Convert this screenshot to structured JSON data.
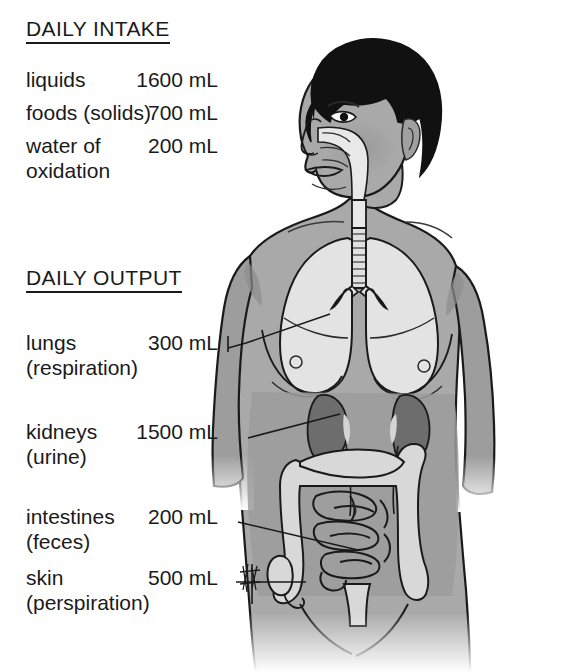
{
  "intake": {
    "heading": "DAILY INTAKE",
    "rows": [
      {
        "name": "liquids",
        "sub": "",
        "value": "1600 mL"
      },
      {
        "name": "foods (solids)",
        "sub": "",
        "value": "700 mL"
      },
      {
        "name": "water of",
        "sub": "oxidation",
        "value": "200 mL"
      }
    ]
  },
  "output": {
    "heading": "DAILY OUTPUT",
    "rows": [
      {
        "name": "lungs",
        "sub": "(respiration)",
        "value": "300 mL"
      },
      {
        "name": "kidneys",
        "sub": "(urine)",
        "value": "1500 mL"
      },
      {
        "name": "intestines",
        "sub": "(feces)",
        "value": "200 mL"
      },
      {
        "name": "skin",
        "sub": "(perspiration)",
        "value": "500 mL"
      }
    ]
  },
  "figure": {
    "parts": [
      "hair",
      "face",
      "nasal-passage",
      "trachea",
      "left-lung",
      "right-lung",
      "left-kidney",
      "right-kidney",
      "ureters",
      "large-intestine",
      "small-intestine",
      "appendix",
      "breasts",
      "arms"
    ],
    "artist_signature": "signature"
  },
  "colors": {
    "background": "#ffffff",
    "skin": "#a9a9a9",
    "skin_shadow": "#8f8f8f",
    "hair": "#111111",
    "lung": "#e3e3e3",
    "kidney": "#6d6d6d",
    "intestine": "#d8d8d8",
    "abdomen_cavity": "#9a9a9a",
    "outline": "#1a1a1a",
    "text": "#1a1a1a"
  }
}
